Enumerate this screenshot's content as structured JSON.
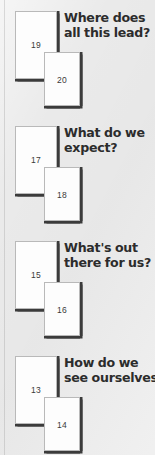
{
  "page": {
    "background_color": "#eaeaea",
    "card_color": "#fdfdfd",
    "card_border_color": "#b9b9b9",
    "shadow_color": "#3b3b3b",
    "text_color": "#2c2c2c",
    "number_color": "#3a3a3a"
  },
  "groups": [
    {
      "card_a_number": "19",
      "card_b_number": "20",
      "heading_line1": "Where does",
      "heading_line2": "all this lead?"
    },
    {
      "card_a_number": "17",
      "card_b_number": "18",
      "heading_line1": "What do we",
      "heading_line2": "expect?"
    },
    {
      "card_a_number": "15",
      "card_b_number": "16",
      "heading_line1": "What's out",
      "heading_line2": "there for us?"
    },
    {
      "card_a_number": "13",
      "card_b_number": "14",
      "heading_line1": "How do we",
      "heading_line2": "see ourselves?"
    }
  ]
}
